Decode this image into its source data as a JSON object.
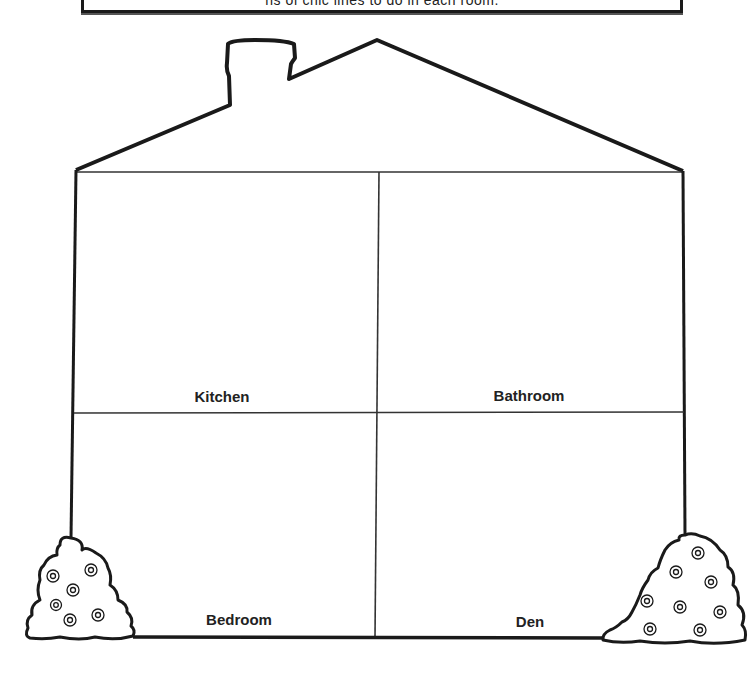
{
  "instructions": {
    "text": "ns of chic lines to do in each room."
  },
  "rooms": [
    {
      "id": "kitchen",
      "label": "Kitchen"
    },
    {
      "id": "bathroom",
      "label": "Bathroom"
    },
    {
      "id": "bedroom",
      "label": "Bedroom"
    },
    {
      "id": "den",
      "label": "Den"
    }
  ],
  "colors": {
    "line": "#1a1a1a",
    "background": "#ffffff"
  }
}
